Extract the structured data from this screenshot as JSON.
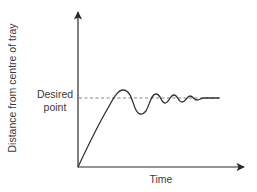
{
  "diagram": {
    "type": "line",
    "y_axis_label": "Distance from centre of tray",
    "x_axis_label": "Time",
    "reference_line_label_line1": "Desired",
    "reference_line_label_line2": "point",
    "reference_line_style": "dashed",
    "curve_behavior": "rises from origin, overshoots desired point, undershoots, then oscillates with decreasing amplitude and settles at desired point",
    "colors": {
      "axis": "#2a2a2a",
      "curve": "#333333",
      "reference_line": "#777777",
      "text": "#3a3a3a"
    }
  }
}
